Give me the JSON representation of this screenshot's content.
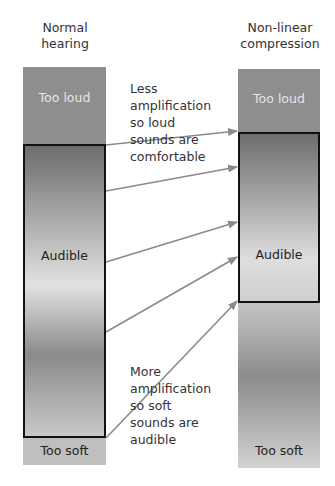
{
  "columns": [
    {
      "title_line1": "Normal",
      "title_line2": "hearing",
      "segments": {
        "top": "Too loud",
        "middle": "Audible",
        "bottom": "Too soft"
      }
    },
    {
      "title_line1": "Non-linear",
      "title_line2": "compression",
      "segments": {
        "top": "Too loud",
        "middle": "Audible",
        "bottom": "Too soft"
      }
    }
  ],
  "annotations": {
    "upper": [
      "Less",
      "amplification",
      "so loud",
      "sounds are",
      "comfortable"
    ],
    "lower": [
      "More",
      "amplification",
      "so soft",
      "sounds are",
      "audible"
    ]
  },
  "colors": {
    "too_loud": "#8c8c8c",
    "audible_dark": "#6e6e6e",
    "audible_light": "#dcdcdc",
    "too_soft": "#bdbdbd",
    "arrow": "#8a8a8a",
    "outline": "#111111"
  },
  "mapping_arrows": [
    {
      "from_y": 144,
      "to_y": 130
    },
    {
      "from_y": 192,
      "to_y": 166
    },
    {
      "from_y": 262,
      "to_y": 222
    },
    {
      "from_y": 332,
      "to_y": 256
    },
    {
      "from_y": 438,
      "to_y": 300
    }
  ]
}
